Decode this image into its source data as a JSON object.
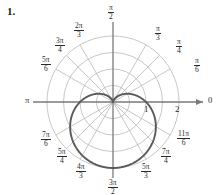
{
  "problem": {
    "number": "1."
  },
  "chart_data": {
    "type": "line",
    "subtype": "polar",
    "title": "",
    "curve_label": "cardioid",
    "equation": "r = 1 - sin(theta)",
    "theta_range_deg": [
      0,
      360
    ],
    "rmax": 2,
    "grid": true,
    "grid_circle_radii": [
      0.5,
      1,
      1.5,
      2
    ],
    "radial_tick_labels": [
      "1",
      "2"
    ],
    "radial_tick_values": [
      1,
      2
    ],
    "angle_labels": [
      {
        "text": "0",
        "kind": "plain",
        "deg": 0
      },
      {
        "numerator": "π",
        "denominator": "6",
        "kind": "frac",
        "deg": 30
      },
      {
        "numerator": "π",
        "denominator": "4",
        "kind": "frac",
        "deg": 45
      },
      {
        "numerator": "π",
        "denominator": "3",
        "kind": "frac",
        "deg": 60
      },
      {
        "numerator": "π",
        "denominator": "2",
        "kind": "frac",
        "deg": 90
      },
      {
        "numerator": "2π",
        "denominator": "3",
        "kind": "frac",
        "deg": 120
      },
      {
        "numerator": "3π",
        "denominator": "4",
        "kind": "frac",
        "deg": 135
      },
      {
        "numerator": "5π",
        "denominator": "6",
        "kind": "frac",
        "deg": 150
      },
      {
        "text": "π",
        "kind": "plain",
        "deg": 180
      },
      {
        "numerator": "7π",
        "denominator": "6",
        "kind": "frac",
        "deg": 210
      },
      {
        "numerator": "5π",
        "denominator": "4",
        "kind": "frac",
        "deg": 225
      },
      {
        "numerator": "4π",
        "denominator": "3",
        "kind": "frac",
        "deg": 240
      },
      {
        "numerator": "3π",
        "denominator": "2",
        "kind": "frac",
        "deg": 270
      },
      {
        "numerator": "5π",
        "denominator": "3",
        "kind": "frac",
        "deg": 300
      },
      {
        "numerator": "7π",
        "denominator": "4",
        "kind": "frac",
        "deg": 315
      },
      {
        "numerator": "11π",
        "denominator": "6",
        "kind": "frac",
        "deg": 330
      }
    ],
    "colors": {
      "curve": "#5a5a5a",
      "grid": "#b4b4b4",
      "axis": "#7a7a7a",
      "text": "#2a2a2a"
    }
  },
  "labels": {
    "pi_left": "π",
    "zero_right": "0",
    "tick_one": "1",
    "tick_two": "2",
    "f_pi2_num": "π",
    "f_pi2_den": "2",
    "f_pi3_num": "π",
    "f_pi3_den": "3",
    "f_pi4_num": "π",
    "f_pi4_den": "4",
    "f_pi6_num": "π",
    "f_pi6_den": "6",
    "f_2pi3_num": "2π",
    "f_2pi3_den": "3",
    "f_3pi4_num": "3π",
    "f_3pi4_den": "4",
    "f_5pi6_num": "5π",
    "f_5pi6_den": "6",
    "f_7pi6_num": "7π",
    "f_7pi6_den": "6",
    "f_5pi4_num": "5π",
    "f_5pi4_den": "4",
    "f_4pi3_num": "4π",
    "f_4pi3_den": "3",
    "f_3pi2_num": "3π",
    "f_3pi2_den": "2",
    "f_5pi3_num": "5π",
    "f_5pi3_den": "3",
    "f_7pi4_num": "7π",
    "f_7pi4_den": "4",
    "f_11pi6_num": "11π",
    "f_11pi6_den": "6"
  }
}
